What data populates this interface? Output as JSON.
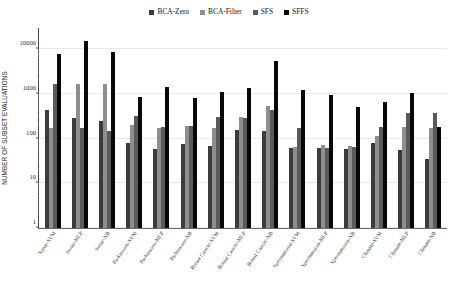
{
  "chart_data": {
    "type": "bar",
    "title": "",
    "xlabel": "",
    "ylabel": "NUMBER OF SUBSET EVALUATIONS",
    "yscale": "log",
    "ylim": [
      1,
      30000
    ],
    "ytick_labels": [
      "1",
      "10",
      "100",
      "1000",
      "10000"
    ],
    "ytick_values": [
      1,
      10,
      100,
      1000,
      10000
    ],
    "grid": true,
    "legend_position": "top-center",
    "categories": [
      "Sonar-SVM",
      "Sonar-MLP",
      "Sonar-NB",
      "Parkinsons-SVM",
      "Parkinsons-MLP",
      "Parkinsons-NB",
      "Breast Cancer-SVM",
      "Breast Cancer-MLP",
      "Breast Cancer-NB",
      "Spermatozoa-SVM",
      "Spermatozoa-MLP",
      "Spermatozoa-NB",
      "Climate-SVM",
      "Climate-MLP",
      "Climate-NB"
    ],
    "series": [
      {
        "name": "BCA-Zero",
        "color": "#3b3b3b",
        "values": [
          430,
          290,
          250,
          80,
          60,
          75,
          70,
          160,
          150,
          62,
          62,
          60,
          80,
          57,
          35
        ]
      },
      {
        "name": "BCA-Filter",
        "color": "#8e8e8e",
        "values": [
          170,
          1700,
          1700,
          200,
          170,
          195,
          170,
          300,
          530,
          65,
          72,
          70,
          115,
          180,
          175
        ]
      },
      {
        "name": "SFS",
        "color": "#5a5a5a",
        "values": [
          1700,
          170,
          150,
          330,
          180,
          190,
          310,
          290,
          430,
          175,
          62,
          66,
          180,
          380,
          370
        ]
      },
      {
        "name": "SFFS",
        "color": "#080808",
        "values": [
          8000,
          15000,
          8500,
          850,
          1400,
          830,
          1100,
          1350,
          5500,
          1200,
          970,
          520,
          660,
          1050,
          180
        ]
      }
    ]
  },
  "legend": {
    "items": [
      {
        "label": "BCA-Zero"
      },
      {
        "label": "BCA-Filter"
      },
      {
        "label": "SFS"
      },
      {
        "label": "SFFS"
      }
    ]
  }
}
